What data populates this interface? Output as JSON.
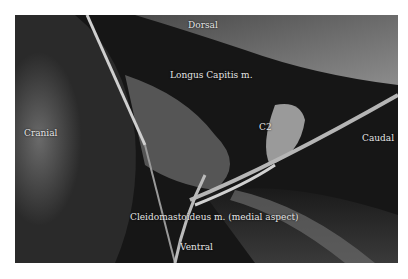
{
  "figure": {
    "type": "grayscale anatomical dissection photograph",
    "labels": {
      "dorsal": "Dorsal",
      "longus_capitis": "Longus Capitis m.",
      "cranial": "Cranial",
      "c2": "C2",
      "caudal": "Caudal",
      "cleidomastoideus": "Cleidomastoideus m. (medial aspect)",
      "ventral": "Ventral"
    }
  }
}
